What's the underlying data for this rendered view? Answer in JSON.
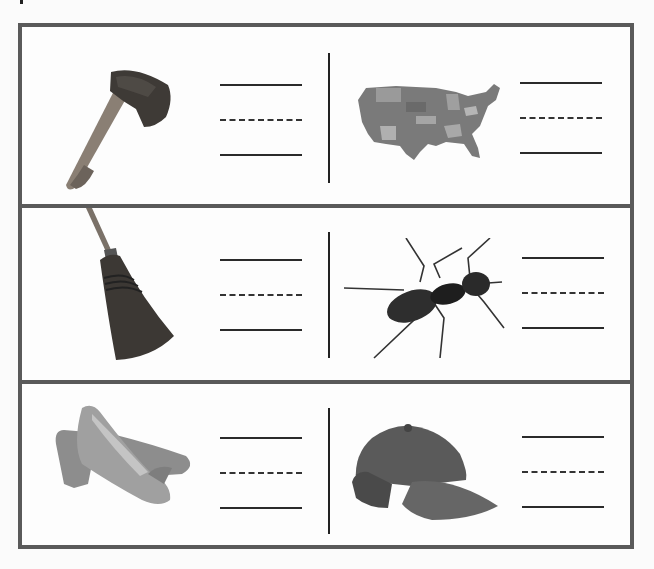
{
  "worksheet": {
    "type": "picture word-writing worksheet",
    "rows": [
      {
        "items": [
          {
            "picture": "axe",
            "lines": [
              "solid",
              "dashed",
              "solid"
            ]
          },
          {
            "picture": "usa-map",
            "lines": [
              "solid",
              "dashed",
              "solid"
            ]
          }
        ]
      },
      {
        "items": [
          {
            "picture": "broom",
            "lines": [
              "solid",
              "dashed",
              "solid"
            ]
          },
          {
            "picture": "ant",
            "lines": [
              "solid",
              "dashed",
              "solid"
            ]
          }
        ]
      },
      {
        "items": [
          {
            "picture": "shoes",
            "lines": [
              "solid",
              "dashed",
              "solid"
            ]
          },
          {
            "picture": "cap",
            "lines": [
              "solid",
              "dashed",
              "solid"
            ]
          }
        ]
      }
    ],
    "colors": {
      "border": "#5a5a5a",
      "line": "#2a2a2a",
      "background": "#fdfdfd"
    }
  }
}
